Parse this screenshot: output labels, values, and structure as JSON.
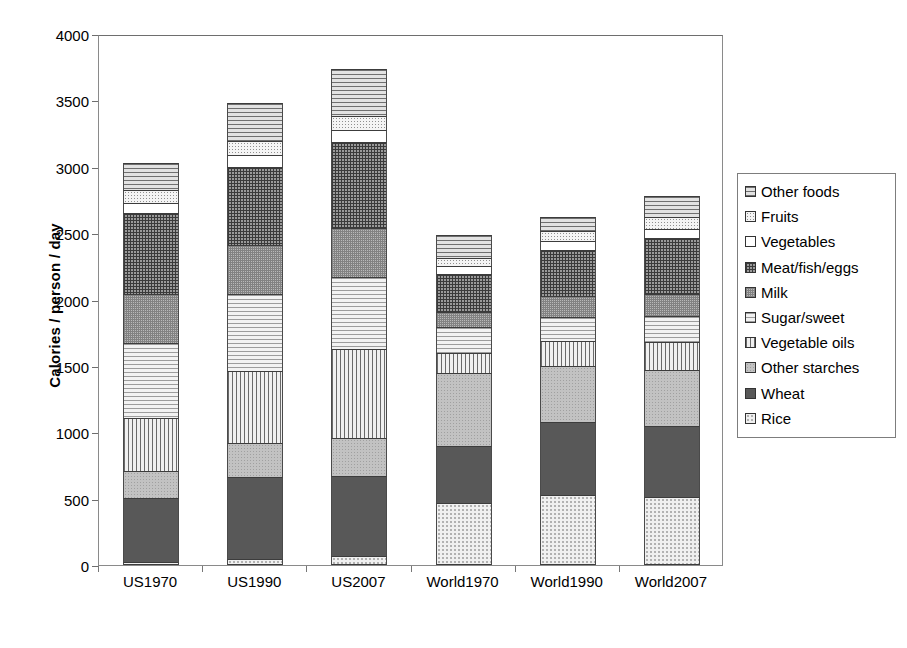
{
  "chart_data": {
    "type": "bar",
    "subtype": "stacked-vertical",
    "title": "",
    "xlabel": "",
    "ylabel": "Calories / person / day",
    "ylim": [
      0,
      4000
    ],
    "yticks": [
      0,
      500,
      1000,
      1500,
      2000,
      2500,
      3000,
      3500,
      4000
    ],
    "grid": false,
    "legend_position": "right",
    "categories": [
      "US1970",
      "US1990",
      "US2007",
      "World1970",
      "World1990",
      "World2007"
    ],
    "series": [
      {
        "name": "Rice",
        "pattern": "dots-light",
        "values": [
          20,
          45,
          70,
          465,
          530,
          515
        ]
      },
      {
        "name": "Wheat",
        "pattern": "solid-dark",
        "values": [
          485,
          615,
          600,
          435,
          545,
          535
        ]
      },
      {
        "name": "Other starches",
        "pattern": "speckle",
        "values": [
          205,
          260,
          290,
          545,
          425,
          420
        ]
      },
      {
        "name": "Vegetable oils",
        "pattern": "vlines",
        "values": [
          395,
          545,
          665,
          150,
          185,
          210
        ]
      },
      {
        "name": "Sugar/sweet",
        "pattern": "hlines-light",
        "values": [
          565,
          575,
          545,
          195,
          185,
          195
        ]
      },
      {
        "name": "Other starches2",
        "pattern": "checker",
        "values": [
          370,
          370,
          370,
          120,
          155,
          165
        ]
      },
      {
        "name": "Meat/fish/eggs",
        "pattern": "grid-dense",
        "values": [
          610,
          590,
          645,
          285,
          345,
          420
        ]
      },
      {
        "name": "Vegetables",
        "pattern": "white",
        "values": [
          80,
          90,
          95,
          55,
          70,
          75
        ]
      },
      {
        "name": "Fruits",
        "pattern": "dots-fine",
        "values": [
          95,
          105,
          105,
          60,
          75,
          85
        ]
      },
      {
        "name": "Other foods",
        "pattern": "hlines",
        "values": [
          205,
          285,
          350,
          180,
          105,
          160
        ]
      }
    ],
    "totals": [
      3030,
      3480,
      3735,
      2490,
      2620,
      2780
    ]
  },
  "legend": {
    "items": [
      {
        "label": "Other foods",
        "pattern": "hlines"
      },
      {
        "label": "Fruits",
        "pattern": "dots-fine"
      },
      {
        "label": "Vegetables",
        "pattern": "white"
      },
      {
        "label": "Meat/fish/eggs",
        "pattern": "grid-dense"
      },
      {
        "label": "Milk",
        "pattern": "checker"
      },
      {
        "label": "Sugar/sweet",
        "pattern": "hlines-light"
      },
      {
        "label": "Vegetable oils",
        "pattern": "vlines"
      },
      {
        "label": "Other starches",
        "pattern": "speckle"
      },
      {
        "label": "Wheat",
        "pattern": "solid-dark"
      },
      {
        "label": "Rice",
        "pattern": "dots-light"
      }
    ]
  },
  "bars": [
    {
      "category": "US1970",
      "total": 3030,
      "segments": [
        {
          "name": "Other foods",
          "value": 205,
          "pattern": "hlines"
        },
        {
          "name": "Fruits",
          "value": 95,
          "pattern": "dots-fine"
        },
        {
          "name": "Vegetables",
          "value": 80,
          "pattern": "white"
        },
        {
          "name": "Meat/fish/eggs",
          "value": 610,
          "pattern": "grid-dense"
        },
        {
          "name": "Milk",
          "value": 370,
          "pattern": "checker"
        },
        {
          "name": "Sugar/sweet",
          "value": 565,
          "pattern": "hlines-light"
        },
        {
          "name": "Vegetable oils",
          "value": 395,
          "pattern": "vlines"
        },
        {
          "name": "Other starches",
          "value": 205,
          "pattern": "speckle"
        },
        {
          "name": "Wheat",
          "value": 485,
          "pattern": "solid-dark"
        },
        {
          "name": "Rice",
          "value": 20,
          "pattern": "dots-light"
        }
      ]
    },
    {
      "category": "US1990",
      "total": 3480,
      "segments": [
        {
          "name": "Other foods",
          "value": 285,
          "pattern": "hlines"
        },
        {
          "name": "Fruits",
          "value": 105,
          "pattern": "dots-fine"
        },
        {
          "name": "Vegetables",
          "value": 90,
          "pattern": "white"
        },
        {
          "name": "Meat/fish/eggs",
          "value": 590,
          "pattern": "grid-dense"
        },
        {
          "name": "Milk",
          "value": 370,
          "pattern": "checker"
        },
        {
          "name": "Sugar/sweet",
          "value": 575,
          "pattern": "hlines-light"
        },
        {
          "name": "Vegetable oils",
          "value": 545,
          "pattern": "vlines"
        },
        {
          "name": "Other starches",
          "value": 260,
          "pattern": "speckle"
        },
        {
          "name": "Wheat",
          "value": 615,
          "pattern": "solid-dark"
        },
        {
          "name": "Rice",
          "value": 45,
          "pattern": "dots-light"
        }
      ]
    },
    {
      "category": "US2007",
      "total": 3735,
      "segments": [
        {
          "name": "Other foods",
          "value": 350,
          "pattern": "hlines"
        },
        {
          "name": "Fruits",
          "value": 105,
          "pattern": "dots-fine"
        },
        {
          "name": "Vegetables",
          "value": 95,
          "pattern": "white"
        },
        {
          "name": "Meat/fish/eggs",
          "value": 645,
          "pattern": "grid-dense"
        },
        {
          "name": "Milk",
          "value": 370,
          "pattern": "checker"
        },
        {
          "name": "Sugar/sweet",
          "value": 545,
          "pattern": "hlines-light"
        },
        {
          "name": "Vegetable oils",
          "value": 665,
          "pattern": "vlines"
        },
        {
          "name": "Other starches",
          "value": 290,
          "pattern": "speckle"
        },
        {
          "name": "Wheat",
          "value": 600,
          "pattern": "solid-dark"
        },
        {
          "name": "Rice",
          "value": 70,
          "pattern": "dots-light"
        }
      ]
    },
    {
      "category": "World1970",
      "total": 2490,
      "segments": [
        {
          "name": "Other foods",
          "value": 180,
          "pattern": "hlines"
        },
        {
          "name": "Fruits",
          "value": 60,
          "pattern": "dots-fine"
        },
        {
          "name": "Vegetables",
          "value": 55,
          "pattern": "white"
        },
        {
          "name": "Meat/fish/eggs",
          "value": 285,
          "pattern": "grid-dense"
        },
        {
          "name": "Milk",
          "value": 120,
          "pattern": "checker"
        },
        {
          "name": "Sugar/sweet",
          "value": 195,
          "pattern": "hlines-light"
        },
        {
          "name": "Vegetable oils",
          "value": 150,
          "pattern": "vlines"
        },
        {
          "name": "Other starches",
          "value": 545,
          "pattern": "speckle"
        },
        {
          "name": "Wheat",
          "value": 435,
          "pattern": "solid-dark"
        },
        {
          "name": "Rice",
          "value": 465,
          "pattern": "dots-light"
        }
      ]
    },
    {
      "category": "World1990",
      "total": 2620,
      "segments": [
        {
          "name": "Other foods",
          "value": 105,
          "pattern": "hlines"
        },
        {
          "name": "Fruits",
          "value": 75,
          "pattern": "dots-fine"
        },
        {
          "name": "Vegetables",
          "value": 70,
          "pattern": "white"
        },
        {
          "name": "Meat/fish/eggs",
          "value": 345,
          "pattern": "grid-dense"
        },
        {
          "name": "Milk",
          "value": 155,
          "pattern": "checker"
        },
        {
          "name": "Sugar/sweet",
          "value": 185,
          "pattern": "hlines-light"
        },
        {
          "name": "Vegetable oils",
          "value": 185,
          "pattern": "vlines"
        },
        {
          "name": "Other starches",
          "value": 425,
          "pattern": "speckle"
        },
        {
          "name": "Wheat",
          "value": 545,
          "pattern": "solid-dark"
        },
        {
          "name": "Rice",
          "value": 530,
          "pattern": "dots-light"
        }
      ]
    },
    {
      "category": "World2007",
      "total": 2780,
      "segments": [
        {
          "name": "Other foods",
          "value": 160,
          "pattern": "hlines"
        },
        {
          "name": "Fruits",
          "value": 85,
          "pattern": "dots-fine"
        },
        {
          "name": "Vegetables",
          "value": 75,
          "pattern": "white"
        },
        {
          "name": "Meat/fish/eggs",
          "value": 420,
          "pattern": "grid-dense"
        },
        {
          "name": "Milk",
          "value": 165,
          "pattern": "checker"
        },
        {
          "name": "Sugar/sweet",
          "value": 195,
          "pattern": "hlines-light"
        },
        {
          "name": "Vegetable oils",
          "value": 210,
          "pattern": "vlines"
        },
        {
          "name": "Other starches",
          "value": 420,
          "pattern": "speckle"
        },
        {
          "name": "Wheat",
          "value": 535,
          "pattern": "solid-dark"
        },
        {
          "name": "Rice",
          "value": 515,
          "pattern": "dots-light"
        }
      ]
    }
  ],
  "axis": {
    "y_title": "Calories / person / day",
    "y_min": 0,
    "y_max": 4000,
    "y_ticks": [
      "4000",
      "3500",
      "3000",
      "2500",
      "2000",
      "1500",
      "1000",
      "500",
      "0"
    ]
  },
  "colors": {
    "frame": "#8a8a8a",
    "segment_border": "#3c3c3c",
    "text": "#000000",
    "background": "#ffffff"
  }
}
